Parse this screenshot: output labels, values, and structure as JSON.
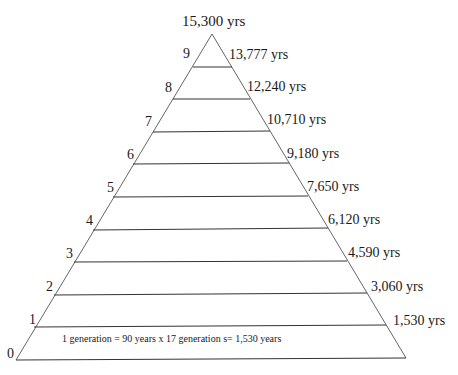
{
  "diagram": {
    "type": "generational-pyramid",
    "apex_label": "15,300 yrs",
    "footnote": "1 generation = 90 years x 17 generation s= 1,530 years",
    "levels": [
      {
        "generation": "0",
        "years": ""
      },
      {
        "generation": "1",
        "years": "1,530 yrs"
      },
      {
        "generation": "2",
        "years": "3,060 yrs"
      },
      {
        "generation": "3",
        "years": "4,590 yrs"
      },
      {
        "generation": "4",
        "years": "6,120 yrs"
      },
      {
        "generation": "5",
        "years": "7,650 yrs"
      },
      {
        "generation": "6",
        "years": "9,180 yrs"
      },
      {
        "generation": "7",
        "years": "10,710 yrs"
      },
      {
        "generation": "8",
        "years": "12,240 yrs"
      },
      {
        "generation": "9",
        "years": "13,777 yrs"
      }
    ],
    "colors": {
      "line": "#3a3a3a",
      "text": "#1a1a1a",
      "background": "#ffffff"
    }
  }
}
